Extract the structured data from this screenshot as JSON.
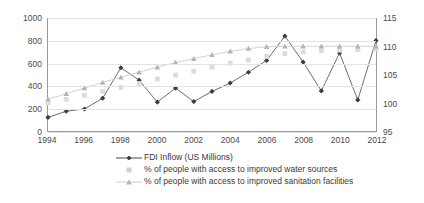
{
  "chart_data": {
    "type": "line",
    "title": "",
    "xlabel": "",
    "ylabel": "",
    "x": [
      1994,
      1995,
      1996,
      1997,
      1998,
      1999,
      2000,
      2001,
      2002,
      2003,
      2004,
      2005,
      2006,
      2007,
      2008,
      2009,
      2010,
      2011,
      2012
    ],
    "axes": {
      "left": {
        "label": "",
        "ylim": [
          0,
          1000
        ],
        "ticks": [
          "0",
          "200",
          "400",
          "600",
          "800",
          "1000"
        ],
        "tick_values": [
          0,
          200,
          400,
          600,
          800,
          1000
        ]
      },
      "right": {
        "label": "",
        "ylim": [
          95,
          115
        ],
        "ticks": [
          "95",
          "100",
          "105",
          "110",
          "115"
        ],
        "tick_values": [
          95,
          100,
          105,
          110,
          115
        ]
      }
    },
    "x_ticks": [
      "1994",
      "1996",
      "1998",
      "2000",
      "2002",
      "2004",
      "2006",
      "2008",
      "2010",
      "2012"
    ],
    "x_tick_values": [
      1994,
      1996,
      1998,
      2000,
      2002,
      2004,
      2006,
      2008,
      2010,
      2012
    ],
    "grid": true,
    "legend_position": "bottom",
    "series": [
      {
        "name": "FDI Inflow (US Millions)",
        "axis": "left",
        "marker": "diamond",
        "color": "#4a4a4a",
        "values": [
          120,
          175,
          195,
          290,
          560,
          450,
          255,
          380,
          260,
          350,
          425,
          520,
          625,
          840,
          610,
          355,
          690,
          275,
          800
        ]
      },
      {
        "name": "% of people with access to improved water sources",
        "axis": "right",
        "marker": "square",
        "color": "#d8d8d8",
        "values": [
          100.0,
          100.6,
          101.3,
          102.0,
          102.7,
          103.4,
          104.2,
          104.9,
          105.6,
          106.3,
          107.0,
          107.6,
          108.2,
          108.7,
          109.0,
          109.2,
          109.3,
          109.4,
          109.5
        ]
      },
      {
        "name": "% of people with access to improved sanitation facilities",
        "axis": "right",
        "marker": "triangle",
        "color": "#b8b8b8",
        "values": [
          100.6,
          101.6,
          102.6,
          103.6,
          104.5,
          105.4,
          106.3,
          107.1,
          107.8,
          108.5,
          109.1,
          109.6,
          109.9,
          110.0,
          110.0,
          110.0,
          110.0,
          110.0,
          110.0
        ]
      }
    ]
  },
  "legend": {
    "items": [
      {
        "label": "FDI Inflow (US Millions)",
        "marker": "diamond"
      },
      {
        "label": "% of people with access to improved water sources",
        "marker": "square"
      },
      {
        "label": "% of people with access to improved sanitation facilities",
        "marker": "triangle"
      }
    ]
  }
}
